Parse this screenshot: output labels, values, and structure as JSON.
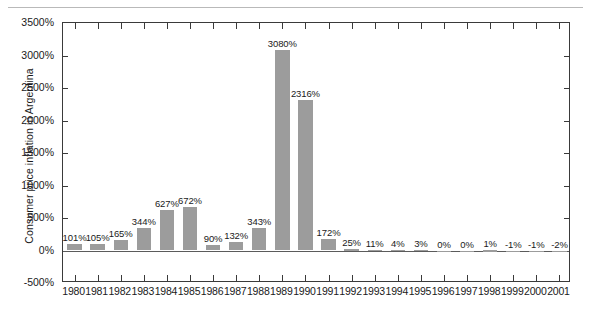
{
  "chart_data": {
    "type": "bar",
    "title": "",
    "xlabel": "",
    "ylabel": "Consumer price inflation in Argentina",
    "ylim": [
      -500,
      3500
    ],
    "ytick_labels": [
      "3500%",
      "3000%",
      "2500%",
      "2000%",
      "1500%",
      "1000%",
      "500%",
      "0%",
      "-500%"
    ],
    "ytick_values": [
      3500,
      3000,
      2500,
      2000,
      1500,
      1000,
      500,
      0,
      -500
    ],
    "grid": false,
    "legend": "none",
    "bar_color": "#9c9c9c",
    "axis_color": "#3a3a3a",
    "categories": [
      "1980",
      "1981",
      "1982",
      "1983",
      "1984",
      "1985",
      "1986",
      "1987",
      "1988",
      "1989",
      "1990",
      "1991",
      "1992",
      "1993",
      "1994",
      "1995",
      "1996",
      "1997",
      "1998",
      "1999",
      "2000",
      "2001"
    ],
    "values": [
      101,
      105,
      165,
      344,
      627,
      672,
      90,
      132,
      343,
      3080,
      2316,
      172,
      25,
      11,
      4,
      3,
      0,
      0,
      1,
      -1,
      -1,
      -2
    ],
    "data_labels": [
      "101%",
      "105%",
      "165%",
      "344%",
      "627%",
      "672%",
      "90%",
      "132%",
      "343%",
      "3080%",
      "2316%",
      "172%",
      "25%",
      "11%",
      "4%",
      "3%",
      "0%",
      "0%",
      "1%",
      "-1%",
      "-1%",
      "-2%"
    ]
  }
}
